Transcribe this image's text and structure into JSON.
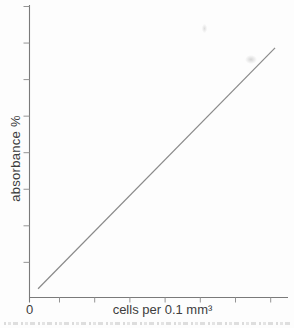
{
  "figure": {
    "ylabel": "absorbance %",
    "xlabel": "cells per 0.1 mm³",
    "origin_tick_label": "0"
  },
  "chart_data": {
    "type": "line",
    "title": "",
    "xlabel": "cells per 0.1 mm³",
    "ylabel": "absorbance %",
    "x_tick_labels": [
      "0"
    ],
    "y_tick_labels": [],
    "num_x_ticks": 7,
    "num_y_ticks": 8,
    "grid": false,
    "legend": false,
    "axis_numeric_scale": "unlabeled except 0 at origin",
    "series": [
      {
        "name": "calibration-line",
        "description": "single straight line rising linearly from just above the origin to the upper right of the plot",
        "points_axis_fraction": [
          [
            0.035,
            0.03
          ],
          [
            0.95,
            0.855
          ]
        ]
      }
    ]
  },
  "colors": {
    "background": "#fdfdfd",
    "axis": "#7a7a7a",
    "tick": "#949494",
    "line": "#8a8a8a",
    "text": "#3d3d3d"
  }
}
